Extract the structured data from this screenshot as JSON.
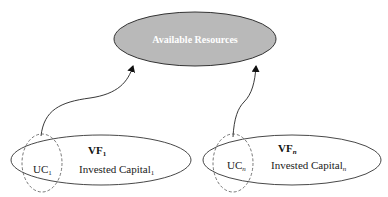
{
  "diagram": {
    "resources": {
      "label": "Available Resources",
      "fill": "#b9b9b9"
    },
    "firms": [
      {
        "vf_label": "VF",
        "vf_sub": "1",
        "uc_label": "UC",
        "uc_sub": "1",
        "capital_label": "Invested Capital",
        "capital_sub": "1"
      },
      {
        "vf_label": "VF",
        "vf_sub": "n",
        "uc_label": "UC",
        "uc_sub": "n",
        "capital_label": "Invested Capital",
        "capital_sub": "n"
      }
    ]
  }
}
